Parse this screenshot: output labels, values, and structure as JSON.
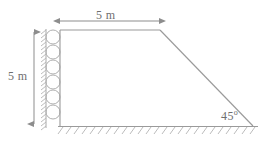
{
  "figure": {
    "type": "engineering-cross-section",
    "stroke_color": "#9a9a9a",
    "text_color": "#6e6e6e",
    "background_color": "#ffffff"
  },
  "dimensions": {
    "crest_width": {
      "value": "5 m",
      "orientation": "horizontal",
      "position": "top"
    },
    "height": {
      "value": "5 m",
      "orientation": "vertical",
      "position": "left"
    },
    "slope_angle": {
      "value": "45",
      "degree_symbol": "o",
      "position": "bottom-right"
    }
  },
  "geometry": {
    "crest": {
      "x1": 60,
      "y1": 30,
      "x2": 160,
      "y2": 30
    },
    "left_wall": {
      "x1": 60,
      "y1": 30,
      "x2": 60,
      "y2": 126
    },
    "ground": {
      "x1": 60,
      "y1": 126,
      "x2": 258,
      "y2": 126
    },
    "slope_face": {
      "x1": 160,
      "y1": 30,
      "x2": 253,
      "y2": 126
    },
    "top_dimension_line": {
      "x1": 58,
      "y": 21,
      "x2": 161
    },
    "left_dimension_line": {
      "x": 34,
      "y1": 30,
      "y2": 126
    },
    "drain_circles": {
      "count": 6,
      "cx": 52,
      "cy_start": 36,
      "spacing": 16,
      "radius": 7
    },
    "wall_hatch": {
      "x": 46,
      "y_start": 30,
      "y_end": 127,
      "count": 25,
      "length": 6
    },
    "ground_hatch": {
      "y": 127,
      "x_start": 58,
      "x_end": 258,
      "count": 25,
      "length": 7
    }
  },
  "icons": {
    "arrow_head": "arrow-head-icon",
    "hatch": "hatch-icon",
    "circle_drain": "drain-circle-icon"
  }
}
